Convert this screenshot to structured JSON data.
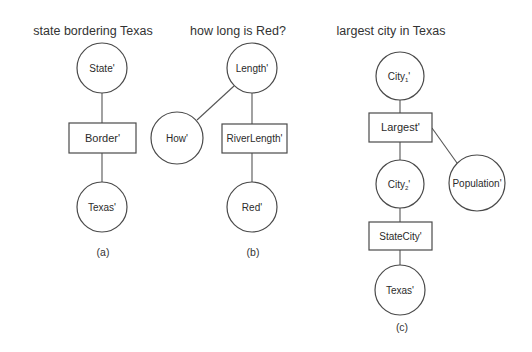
{
  "diagrams": [
    {
      "id": "a",
      "title": "state bordering Texas",
      "caption": "(a)",
      "nodes": [
        {
          "label": "State'",
          "shape": "circle"
        },
        {
          "label": "Border'",
          "shape": "box"
        },
        {
          "label": "Texas'",
          "shape": "circle"
        }
      ],
      "edges": [
        [
          "State'",
          "Border'"
        ],
        [
          "Border'",
          "Texas'"
        ]
      ]
    },
    {
      "id": "b",
      "title": "how long is Red?",
      "caption": "(b)",
      "nodes": [
        {
          "label": "Length'",
          "shape": "circle"
        },
        {
          "label": "How'",
          "shape": "circle"
        },
        {
          "label": "RiverLength'",
          "shape": "box"
        },
        {
          "label": "Red'",
          "shape": "circle"
        }
      ],
      "edges": [
        [
          "Length'",
          "How'"
        ],
        [
          "Length'",
          "RiverLength'"
        ],
        [
          "RiverLength'",
          "Red'"
        ]
      ]
    },
    {
      "id": "c",
      "title": "largest city in Texas",
      "caption": "(c)",
      "nodes": [
        {
          "label": "City",
          "sub": "1",
          "suffix": "'",
          "shape": "circle"
        },
        {
          "label": "Largest'",
          "shape": "box"
        },
        {
          "label": "Population'",
          "shape": "circle"
        },
        {
          "label": "City",
          "sub": "2",
          "suffix": "'",
          "shape": "circle"
        },
        {
          "label": "StateCity'",
          "shape": "box"
        },
        {
          "label": "Texas'",
          "shape": "circle"
        }
      ],
      "edges": [
        [
          "City1'",
          "Largest'"
        ],
        [
          "Largest'",
          "Population'"
        ],
        [
          "Largest'",
          "City2'"
        ],
        [
          "City2'",
          "StateCity'"
        ],
        [
          "StateCity'",
          "Texas'"
        ]
      ]
    }
  ]
}
